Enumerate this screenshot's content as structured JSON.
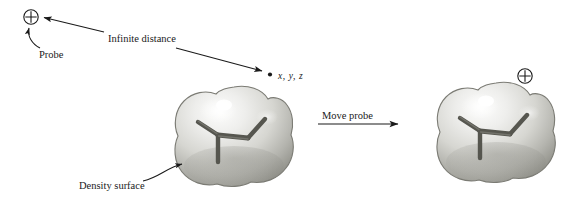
{
  "figure": {
    "background_color": "#ffffff",
    "width": 566,
    "height": 209
  },
  "labels": {
    "infinite_distance": "Infinite distance",
    "probe": "Probe",
    "density_surface": "Density surface",
    "move_probe": "Move probe",
    "coordinate_point": "x, y, z"
  },
  "icons": {
    "probe_symbol": "circled-plus",
    "point_marker": "filled-dot"
  },
  "colors": {
    "ink": "#1a1a1a",
    "surface_light": "#f2f2f0",
    "surface_mid": "#c9c9c4",
    "surface_dark": "#8e8e88",
    "surface_edge": "#6f6f69",
    "skeleton": "#5a5a54",
    "highlight": "#ffffff"
  },
  "panels": [
    {
      "id": "left-panel",
      "name": "probe-at-infinite-distance",
      "probe_position": "upper-left",
      "has_distance_arrow": true,
      "has_density_surface_callout": true
    },
    {
      "id": "right-panel",
      "name": "probe-at-density-surface",
      "probe_position": "upper-right-of-molecule",
      "has_distance_arrow": false,
      "has_density_surface_callout": false
    }
  ]
}
